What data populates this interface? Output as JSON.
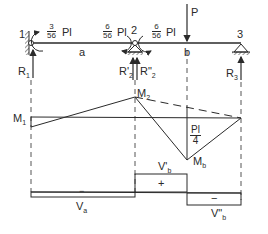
{
  "diagram": {
    "colors": {
      "ink": "#2a2a2a",
      "background": "#ffffff"
    },
    "beam": {
      "nodes": [
        {
          "id": "1",
          "label": "1"
        },
        {
          "id": "2",
          "label": "2"
        },
        {
          "id": "3",
          "label": "3"
        }
      ],
      "spans": [
        {
          "label": "a"
        },
        {
          "label": "b"
        }
      ],
      "load": {
        "label": "P"
      },
      "moments": [
        {
          "num": "3",
          "den": "56",
          "unit": "Pl"
        },
        {
          "num": "6",
          "den": "56",
          "unit": "Pl"
        },
        {
          "num": "6",
          "den": "56",
          "unit": "Pl"
        }
      ],
      "reactions": [
        {
          "label": "R",
          "sub": "1"
        },
        {
          "label": "R'",
          "sub": "2"
        },
        {
          "label": "R\"",
          "sub": "2"
        },
        {
          "label": "R",
          "sub": "3"
        }
      ]
    },
    "moment_diagram": {
      "labels": [
        {
          "label": "M",
          "sub": "1"
        },
        {
          "label": "M",
          "sub": "2"
        },
        {
          "label": "M",
          "sub": "b"
        }
      ],
      "simple_moment": {
        "num": "Pl",
        "den": "4"
      }
    },
    "shear_diagram": {
      "labels": [
        {
          "label": "V",
          "sub": "a"
        },
        {
          "label": "V'",
          "sub": "b"
        },
        {
          "label": "V\"",
          "sub": "b"
        }
      ],
      "signs": [
        "−",
        "+",
        "−"
      ]
    }
  }
}
